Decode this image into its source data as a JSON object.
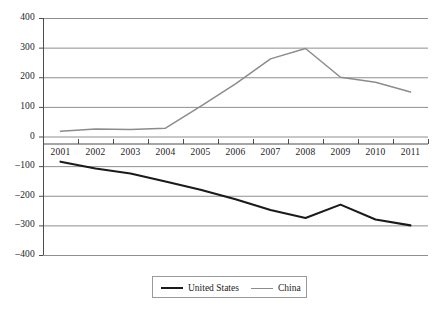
{
  "chart_data": {
    "type": "line",
    "title": "",
    "xlabel": "",
    "ylabel": "",
    "categories": [
      "2001",
      "2002",
      "2003",
      "2004",
      "2005",
      "2006",
      "2007",
      "2008",
      "2009",
      "2010",
      "2011"
    ],
    "series": [
      {
        "name": "United States",
        "color": "#1a1a1a",
        "line_width": 2.1,
        "values": [
          -85,
          -108,
          -125,
          -152,
          -180,
          -212,
          -248,
          -275,
          -230,
          -280,
          -300
        ]
      },
      {
        "name": "China",
        "color": "#8c8c8c",
        "line_width": 1.5,
        "values": [
          18,
          25,
          24,
          28,
          102,
          178,
          262,
          297,
          200,
          183,
          150
        ]
      }
    ],
    "ylim": [
      -400,
      400
    ],
    "yticks": [
      400,
      300,
      200,
      100,
      0,
      -100,
      -200,
      -300,
      -400
    ],
    "ytick_labels": [
      "400",
      "300",
      "200",
      "100",
      "0",
      "–100",
      "–200",
      "–300",
      "–400"
    ],
    "grid": true,
    "grid_color": "#8f8f8f",
    "legend_position": "bottom-center",
    "legend_entries": [
      "United States",
      "China"
    ],
    "axis_color": "#4d4d4d",
    "background": "#ffffff"
  }
}
